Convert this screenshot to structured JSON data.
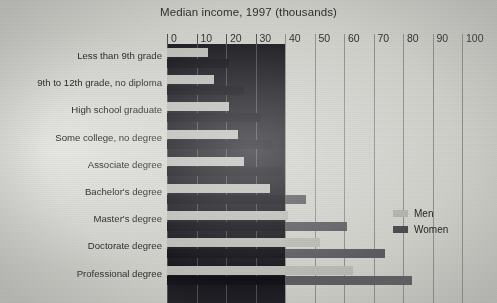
{
  "title": "Median income, 1997 (thousands)",
  "legend": {
    "men_label": "Men",
    "women_label": "Women",
    "men_color": "#b2b2ad",
    "women_color": "#4a4a4e"
  },
  "chart_data": {
    "type": "bar",
    "orientation": "horizontal",
    "title": "Median income, 1997 (thousands)",
    "xlabel": "",
    "ylabel": "",
    "xlim": [
      0,
      100
    ],
    "xticks": [
      0,
      10,
      20,
      30,
      40,
      50,
      60,
      70,
      80,
      90,
      100
    ],
    "xtick_labels": [
      "0",
      "10",
      "20",
      "30",
      "40",
      "50",
      "60",
      "70",
      "80",
      "90",
      "100"
    ],
    "grid": true,
    "legend_position": "right",
    "categories": [
      "Less than 9th grade",
      "9th to 12th grade, no diploma",
      "High school graduate",
      "Some college, no degree",
      "Associate degree",
      "Bachelor's degree",
      "Master's degree",
      "Doctorate degree",
      "Professional degree"
    ],
    "series": [
      {
        "name": "Men",
        "color": "#b2b2ad",
        "values": [
          14,
          16,
          21,
          24,
          26,
          35,
          41,
          52,
          63
        ]
      },
      {
        "name": "Women",
        "color": "#4a4a4e",
        "values": [
          21,
          26,
          32,
          36,
          39,
          47,
          61,
          74,
          83
        ]
      }
    ],
    "annotations": [
      "Dark panel shaded from 0 to 40 on the horizontal axis"
    ]
  }
}
